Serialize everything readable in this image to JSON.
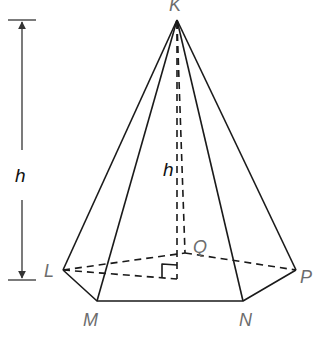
{
  "figure": {
    "type": "right pentagonal pyramid",
    "apex_label": "K",
    "base_vertex_labels": [
      "L",
      "M",
      "N",
      "P",
      "Q"
    ],
    "height_label_side": "h",
    "height_label_inner": "h",
    "colors": {
      "lines": "#1a1a1a",
      "vertex_labels": "#6d6d6d",
      "height_labels": "#111111"
    }
  }
}
